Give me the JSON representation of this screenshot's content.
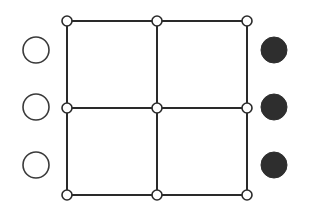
{
  "diagram": {
    "colors": {
      "background": "#ffffff",
      "line": "#2a2a2a",
      "filled_token": "#2e2e2e",
      "open_token_stroke": "#3a3a3a"
    },
    "grid": {
      "xs": [
        67,
        157,
        247
      ],
      "ys": [
        21,
        108,
        195
      ],
      "node_radius": 5,
      "nodes": [
        {
          "id": "n00",
          "col": 0,
          "row": 0
        },
        {
          "id": "n10",
          "col": 1,
          "row": 0
        },
        {
          "id": "n20",
          "col": 2,
          "row": 0
        },
        {
          "id": "n01",
          "col": 0,
          "row": 1
        },
        {
          "id": "n11",
          "col": 1,
          "row": 1
        },
        {
          "id": "n21",
          "col": 2,
          "row": 1
        },
        {
          "id": "n02",
          "col": 0,
          "row": 2
        },
        {
          "id": "n12",
          "col": 1,
          "row": 2
        },
        {
          "id": "n22",
          "col": 2,
          "row": 2
        }
      ]
    },
    "left_tokens": {
      "type": "open",
      "cx": 36,
      "cys": [
        50,
        107,
        165
      ],
      "r": 13
    },
    "right_tokens": {
      "type": "filled",
      "cx": 274,
      "cys": [
        50,
        107,
        165
      ],
      "r": 13
    }
  }
}
